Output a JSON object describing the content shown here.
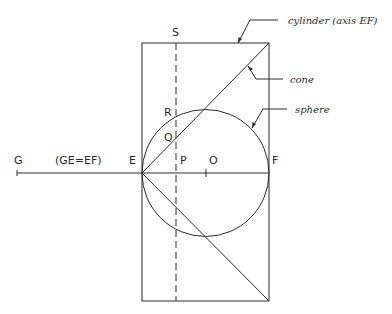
{
  "diagram": {
    "labels": {
      "G": "G",
      "ge_eq_ef": "(GE=EF)",
      "E": "E",
      "P": "P",
      "O": "O",
      "F": "F",
      "Q": "Q",
      "R": "R",
      "S": "S"
    },
    "annotations": {
      "cylinder": "cylinder (axis EF)",
      "cone": "cone",
      "sphere": "sphere"
    }
  }
}
